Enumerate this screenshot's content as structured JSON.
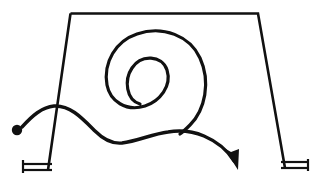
{
  "document": {
    "title": "Hand-drawn sketch: spiral path over trapezoidal frame",
    "description": "A black ink line drawing on a white page showing a wide trapezoid (table-like frame) with splayed legs resting on hatched ground bases, overlaid by a single continuous freehand path that starts at a solid dot on the left, waves across the frame, coils into a one-and-a-half-turn spiral, and exits to the lower right ending in an arrowhead.",
    "background_color": "#ffffff",
    "ink_color": "#111111",
    "canvas": {
      "width": 321,
      "height": 184
    }
  },
  "elements": {
    "frame": {
      "name": "trapezoid-frame",
      "label": "Trapezoidal frame",
      "stroke_width": 2.6,
      "top_bar": {
        "x1": 70,
        "y1": 13,
        "x2": 258,
        "y2": 13
      },
      "left_leg": {
        "x1": 70,
        "y1": 13,
        "x2": 48,
        "y2": 170
      },
      "right_leg": {
        "x1": 258,
        "y1": 13,
        "x2": 285,
        "y2": 168
      },
      "path": "M 70.5 13.5 L 258 13.5 L 285 168 M 70.5 13.5 L 48 170"
    },
    "left_base": {
      "name": "left-ground-base",
      "label": "Left ground base",
      "stroke_width": 2.2,
      "upper_line": {
        "x1": 22,
        "y1": 164,
        "x2": 52,
        "y2": 164
      },
      "lower_line": {
        "x1": 22,
        "y1": 170,
        "x2": 52,
        "y2": 170
      },
      "end_tick": {
        "x1": 23,
        "y1": 160,
        "x2": 23,
        "y2": 173
      }
    },
    "right_base": {
      "name": "right-ground-base",
      "label": "Right ground base",
      "stroke_width": 2.2,
      "upper_line": {
        "x1": 281,
        "y1": 162,
        "x2": 309,
        "y2": 162
      },
      "lower_line": {
        "x1": 281,
        "y1": 168,
        "x2": 309,
        "y2": 168
      },
      "end_tick": {
        "x1": 308,
        "y1": 159,
        "x2": 308,
        "y2": 171
      }
    },
    "start_dot": {
      "name": "path-start-dot",
      "label": "Start point marker",
      "cx": 17,
      "cy": 130,
      "r": 5.2
    },
    "spiral": {
      "name": "spiral-coil",
      "label": "Spiral coil",
      "stroke_width": 3.2,
      "turns": 1.5,
      "outer_bounds": {
        "x_min": 107,
        "x_max": 205,
        "y_min": 31,
        "y_max": 136
      },
      "inner_loop": {
        "cx": 152,
        "cy": 85,
        "rx": 14,
        "ry": 20
      },
      "path": "M 140 104 C 126 100 124 80 132 68 C 141 54 162 55 167 70 C 172 86 160 101 145 106 C 126 112 110 101 107 85 C 103 62 116 41 137 34 C 163 25 190 36 200 58 C 211 82 205 110 190 125 C 186 129 183 132 180 134"
    },
    "flow_path": {
      "name": "freehand-flow-path",
      "label": "Freehand flow path with arrowhead",
      "stroke_width": 3.4,
      "start": {
        "x": 22,
        "y": 127
      },
      "crest": {
        "x": 52,
        "y": 106
      },
      "trough": {
        "x": 112,
        "y": 143
      },
      "crossing": {
        "x": 188,
        "y": 131
      },
      "end": {
        "x": 233,
        "y": 160
      },
      "path": "M 22 127 C 32 116 42 107 54 106 C 70 105 82 118 95 131 C 104 140 112 144 122 143 C 138 141 152 134 168 132 C 180 130 192 131 204 136 C 218 142 228 151 234 161"
    },
    "arrowhead": {
      "name": "flow-arrowhead",
      "label": "Arrowhead terminus",
      "tip": {
        "x": 238,
        "y": 170
      },
      "points": "238,170 224,148 231,152 239,149"
    }
  },
  "legend": {
    "caption": "Sketch of a spiral trajectory over a trapezoidal support frame"
  }
}
